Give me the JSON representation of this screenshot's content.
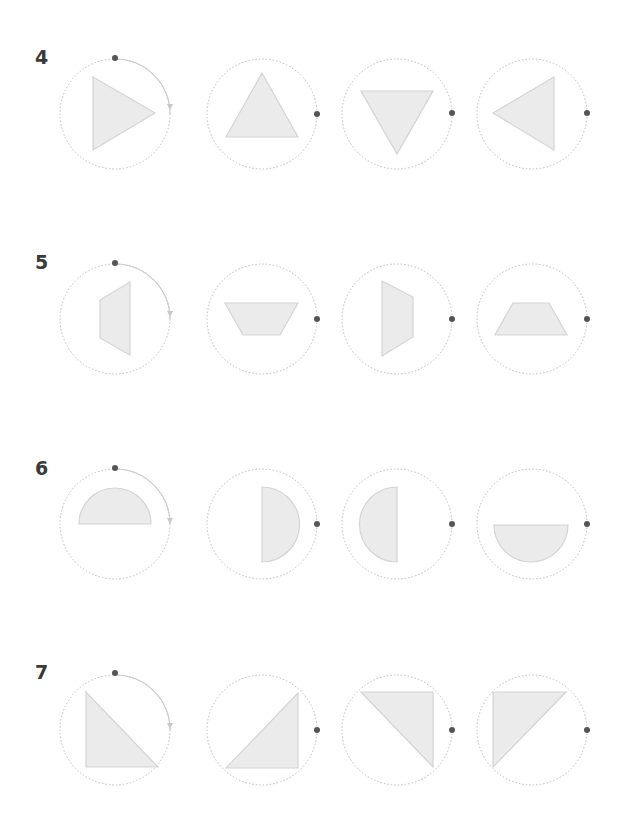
{
  "colors": {
    "shape_fill": "#ebebeb",
    "shape_stroke": "#d4d4d4",
    "circle_stroke": "#bdbdbd",
    "dot": "#555555",
    "arc": "#c8c8c8",
    "label": "#3a3a3a"
  },
  "rows": [
    {
      "label": "4",
      "label_y": 46,
      "cy": 114,
      "shape": "triangle",
      "variants": [
        "pointing-right",
        "pointing-up",
        "pointing-down",
        "pointing-left"
      ]
    },
    {
      "label": "5",
      "label_y": 251,
      "cy": 319,
      "shape": "trapezoid",
      "variants": [
        "long-side-right",
        "long-side-top",
        "long-side-left",
        "long-side-bottom"
      ]
    },
    {
      "label": "6",
      "label_y": 457,
      "cy": 524,
      "shape": "semicircle",
      "variants": [
        "dome-up",
        "dome-right",
        "dome-left",
        "dome-down"
      ]
    },
    {
      "label": "7",
      "label_y": 661,
      "cy": 730,
      "shape": "right-triangle",
      "variants": [
        "right-angle-bottom-left",
        "right-angle-bottom-right",
        "right-angle-top-right",
        "right-angle-top-left"
      ]
    }
  ],
  "columns_cx": [
    115,
    262,
    397,
    532
  ],
  "circle_radius": 55
}
